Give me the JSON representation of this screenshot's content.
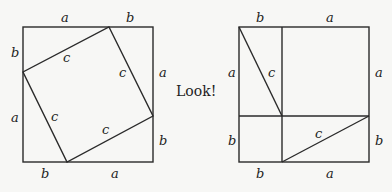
{
  "caption": "Look!",
  "left_square": {
    "labels": {
      "top_left": "a",
      "top_right": "b",
      "left_top": "b",
      "left_bottom": "a",
      "right_top": "a",
      "right_bottom": "b",
      "bottom_left": "b",
      "bottom_right": "a",
      "inner_top": "c",
      "inner_right": "c",
      "inner_left": "c",
      "inner_bottom": "c"
    }
  },
  "right_square": {
    "labels": {
      "top_left": "b",
      "top_right": "a",
      "left_top": "a",
      "left_bottom": "b",
      "right_top": "a",
      "right_bottom": "b",
      "bottom_left": "b",
      "bottom_right": "a",
      "diag_upper": "c",
      "diag_lower": "c"
    }
  },
  "colors": {
    "stroke": "#2a2a2a",
    "background": "#f7f7f5"
  }
}
